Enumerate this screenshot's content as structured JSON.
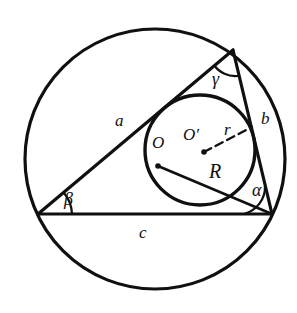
{
  "figure": {
    "background_color": "#ffffff",
    "stroke_color": "#101010",
    "labels": {
      "side_a": "a",
      "side_b": "b",
      "side_c": "c",
      "angle_alpha": "α",
      "angle_beta": "β",
      "angle_gamma": "γ",
      "circumcenter": "O",
      "incenter": "O′",
      "inradius": "r",
      "circumradius": "R"
    },
    "shapes": {
      "circumcircle": {
        "name": "circumcircle",
        "cx": 155,
        "cy": 159,
        "r": 130
      },
      "incircle": {
        "name": "incircle",
        "cx": 200,
        "cy": 150,
        "r": 55
      },
      "triangle": {
        "name": "triangle",
        "vertex_beta": {
          "x": 38,
          "y": 214
        },
        "vertex_gamma": {
          "x": 233,
          "y": 50
        },
        "vertex_alpha": {
          "x": 272,
          "y": 214
        }
      },
      "circumradius_segment": {
        "name": "circumradius-segment",
        "from": {
          "x": 158,
          "y": 166
        },
        "to": {
          "x": 272,
          "y": 214
        }
      },
      "inradius_segment": {
        "name": "inradius-segment",
        "from": {
          "x": 204,
          "y": 152
        },
        "to": {
          "x": 252,
          "y": 127
        },
        "style": "dashed"
      },
      "center_dot_circumcenter": {
        "x": 158,
        "y": 166,
        "r": 2.6
      },
      "center_dot_incenter": {
        "x": 204,
        "y": 152,
        "r": 2.6
      }
    },
    "label_positions": {
      "side_a": {
        "x": 115,
        "y": 112
      },
      "side_b": {
        "x": 261,
        "y": 110
      },
      "side_c": {
        "x": 139,
        "y": 224
      },
      "angle_alpha": {
        "x": 252,
        "y": 181
      },
      "angle_beta": {
        "x": 64,
        "y": 190
      },
      "angle_gamma": {
        "x": 212,
        "y": 70
      },
      "circumcenter": {
        "x": 152,
        "y": 134
      },
      "incenter": {
        "x": 183,
        "y": 126
      },
      "inradius": {
        "x": 224,
        "y": 121
      },
      "circumradius": {
        "x": 209,
        "y": 161
      }
    }
  }
}
